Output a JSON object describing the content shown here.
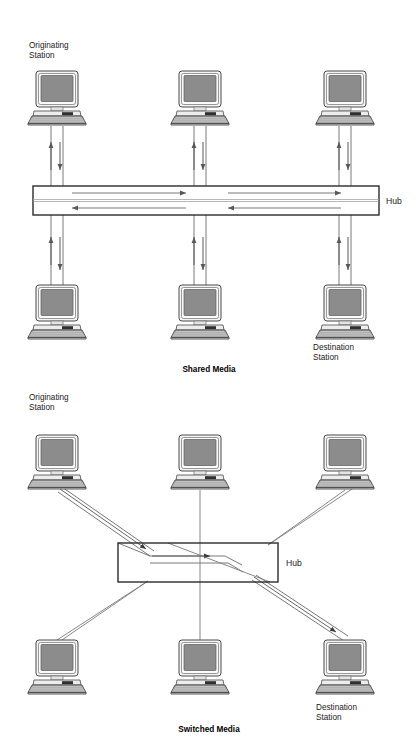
{
  "page": {
    "background": "#ffffff",
    "width": 418,
    "height": 755
  },
  "colors": {
    "line": "#58585a",
    "line_dark": "#2b2b2b",
    "screen_fill": "#8c8c8c",
    "bezel_fill": "#f2f2f2",
    "keyboard_fill": "#a8a8a8",
    "stand_fill": "#d9d9d9",
    "text": "#1a1a1a",
    "hub_fill": "#ffffff",
    "hub_stroke": "#2b2b2b"
  },
  "diagrams": [
    {
      "id": "shared-media",
      "caption": "Shared Media",
      "hub_label": "Hub",
      "hub": {
        "x": 33,
        "y": 186,
        "width": 346,
        "height": 29
      },
      "stations": [
        {
          "id": "top-left",
          "label": "Originating Station",
          "label_lines": [
            "Originating",
            "Station"
          ],
          "label_position": "above",
          "cx": 57,
          "cy": 98,
          "role": "originating"
        },
        {
          "id": "top-mid",
          "label": "",
          "label_lines": [],
          "label_position": "none",
          "cx": 200,
          "cy": 98,
          "role": "station"
        },
        {
          "id": "top-right",
          "label": "",
          "label_lines": [],
          "label_position": "none",
          "cx": 345,
          "cy": 98,
          "role": "station"
        },
        {
          "id": "bot-left",
          "label": "",
          "label_lines": [],
          "label_position": "none",
          "cx": 57,
          "cy": 312,
          "role": "station"
        },
        {
          "id": "bot-mid",
          "label": "",
          "label_lines": [],
          "label_position": "none",
          "cx": 200,
          "cy": 312,
          "role": "station"
        },
        {
          "id": "bot-right",
          "label": "Destination Station",
          "label_lines": [
            "Destination",
            "Station"
          ],
          "label_position": "below",
          "cx": 345,
          "cy": 312,
          "role": "destination"
        }
      ],
      "internal_arrows": [
        {
          "direction": "right",
          "from_x": 72,
          "to_x": 185,
          "y": 193
        },
        {
          "direction": "right",
          "from_x": 228,
          "to_x": 340,
          "y": 193
        },
        {
          "direction": "left",
          "from_x": 185,
          "to_x": 72,
          "y": 208
        },
        {
          "direction": "left",
          "from_x": 340,
          "to_x": 228,
          "y": 208
        }
      ]
    },
    {
      "id": "switched-media",
      "caption": "Switched Media",
      "hub_label": "Hub",
      "hub": {
        "x": 118,
        "y": 543,
        "width": 160,
        "height": 39
      },
      "stations": [
        {
          "id": "top-left",
          "label": "Originating Station",
          "label_lines": [
            "Originating",
            "Station"
          ],
          "label_position": "above",
          "cx": 57,
          "cy": 462,
          "role": "originating"
        },
        {
          "id": "top-mid",
          "label": "",
          "label_lines": [],
          "label_position": "none",
          "cx": 200,
          "cy": 462,
          "role": "station"
        },
        {
          "id": "top-right",
          "label": "",
          "label_lines": [],
          "label_position": "none",
          "cx": 345,
          "cy": 462,
          "role": "station"
        },
        {
          "id": "bot-left",
          "label": "",
          "label_lines": [],
          "label_position": "none",
          "cx": 57,
          "cy": 667,
          "role": "station"
        },
        {
          "id": "bot-mid",
          "label": "",
          "label_lines": [],
          "label_position": "none",
          "cx": 200,
          "cy": 667,
          "role": "station"
        },
        {
          "id": "bot-right",
          "label": "Destination Station",
          "label_lines": [
            "Destination",
            "Station"
          ],
          "label_position": "below",
          "cx": 345,
          "cy": 667,
          "role": "destination"
        }
      ],
      "internal_arrows": [
        {
          "direction": "right",
          "from_x": 152,
          "to_x": 208,
          "y": 556
        }
      ]
    }
  ],
  "labels": {
    "originating_station": "Originating\nStation",
    "destination_station": "Destination\nStation",
    "hub": "Hub",
    "shared_media": "Shared Media",
    "switched_media": "Switched Media"
  }
}
